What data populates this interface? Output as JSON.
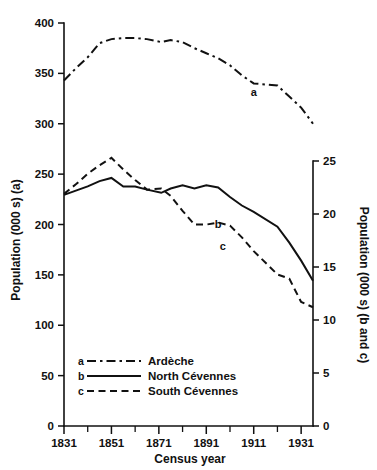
{
  "chart_data": {
    "type": "line",
    "title": "",
    "xlabel": "Census year",
    "ylabel": "Population (000 s) (a)",
    "y2label": "Population (000 s) (b and c)",
    "xlim": [
      1831,
      1936
    ],
    "ylim": [
      0,
      400
    ],
    "y2lim": [
      0,
      25
    ],
    "grid": false,
    "legend_position": "bottom-left",
    "x_major_ticks": [
      1831,
      1851,
      1871,
      1891,
      1911,
      1931
    ],
    "x_minor_ticks": [
      1841,
      1861,
      1881,
      1901,
      1921
    ],
    "y_ticks": [
      0,
      50,
      100,
      150,
      200,
      250,
      300,
      350,
      400
    ],
    "y2_ticks": [
      0,
      5,
      10,
      15,
      20,
      25
    ],
    "x": [
      1831,
      1836,
      1841,
      1846,
      1851,
      1856,
      1861,
      1866,
      1872,
      1876,
      1881,
      1886,
      1891,
      1896,
      1901,
      1906,
      1911,
      1921,
      1926,
      1931,
      1936
    ],
    "series": [
      {
        "key": "a",
        "name": "Ardèche",
        "axis": "left",
        "line_style": "dash-dot",
        "label_x": 1911,
        "label_y": 332,
        "values": [
          343,
          355,
          366,
          380,
          384,
          385,
          385,
          384,
          381,
          383,
          381,
          375,
          370,
          365,
          358,
          348,
          340,
          338,
          327,
          316,
          300
        ]
      },
      {
        "key": "b",
        "name": "North Cévennes",
        "axis": "right",
        "line_style": "solid",
        "label_x": 1896,
        "label_y": 19.1,
        "values": [
          21.8,
          22.2,
          22.6,
          23.1,
          23.4,
          22.6,
          22.6,
          22.3,
          22.0,
          22.4,
          22.7,
          22.4,
          22.7,
          22.5,
          21.6,
          20.8,
          20.2,
          18.8,
          17.3,
          15.6,
          13.7
        ]
      },
      {
        "key": "c",
        "name": "South Cévennes",
        "axis": "right",
        "line_style": "dashed",
        "label_x": 1898,
        "label_y": 17.0,
        "values": [
          21.9,
          22.8,
          23.8,
          24.6,
          25.3,
          24.2,
          23.2,
          22.3,
          22.4,
          21.7,
          20.3,
          19.0,
          19.0,
          19.2,
          18.9,
          17.8,
          16.5,
          14.3,
          13.9,
          11.7,
          11.2
        ]
      }
    ]
  },
  "legend": {
    "entries": [
      {
        "key": "a",
        "label": "Ardèche"
      },
      {
        "key": "b",
        "label": "North Cévennes"
      },
      {
        "key": "c",
        "label": "South Cévennes"
      }
    ]
  }
}
